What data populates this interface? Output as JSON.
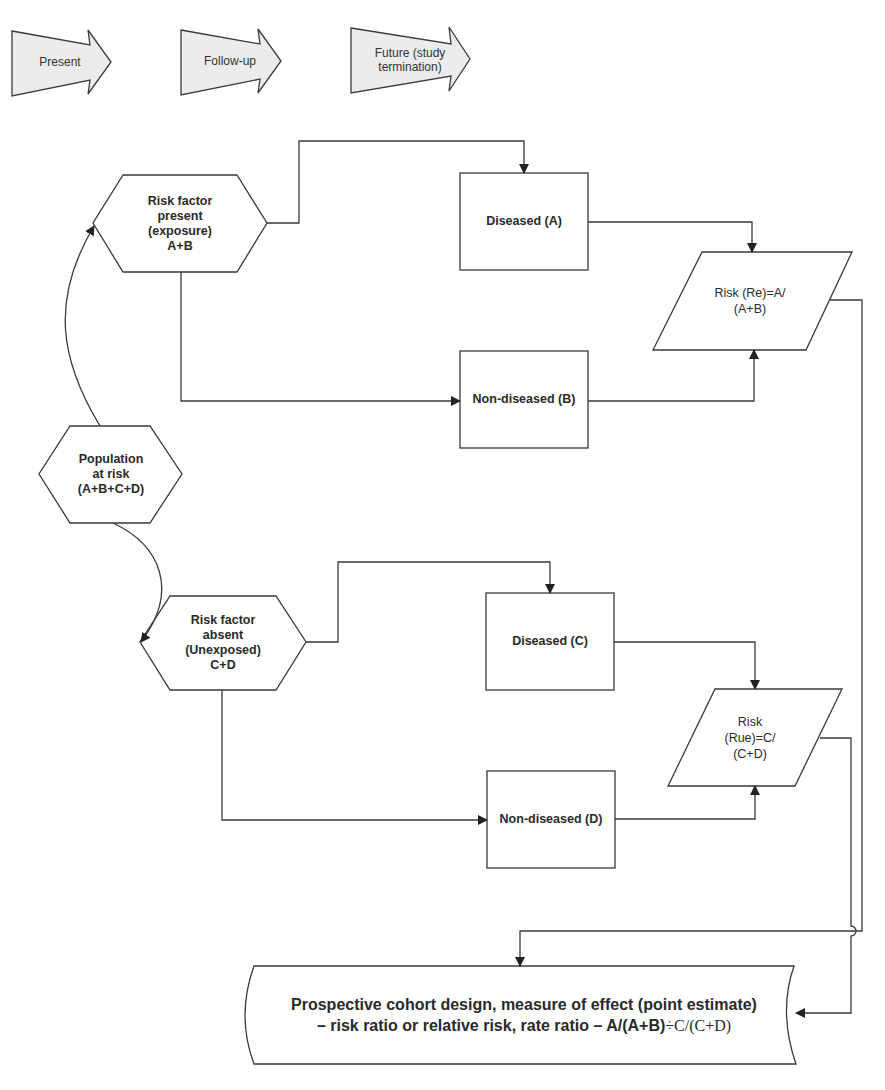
{
  "phases": [
    {
      "label": "Present"
    },
    {
      "label": "Follow-up"
    },
    {
      "label": "Future (study termination)"
    }
  ],
  "nodes": {
    "population": {
      "lines": [
        "Population",
        "at risk",
        "(A+B+C+D)"
      ]
    },
    "exposed": {
      "lines": [
        "Risk factor",
        "present",
        "(exposure)",
        "A+B"
      ]
    },
    "unexposed": {
      "lines": [
        "Risk factor",
        "absent",
        "(Unexposed)",
        "C+D"
      ]
    },
    "diseased_a": {
      "label": "Diseased (A)"
    },
    "nondiseased_b": {
      "label": "Non-diseased (B)"
    },
    "diseased_c": {
      "label": "Diseased (C)"
    },
    "nondiseased_d": {
      "label": "Non-diseased (D)"
    },
    "risk_exposed": {
      "lines": [
        "Risk (Re)=A/",
        "(A+B)"
      ]
    },
    "risk_unexposed": {
      "lines": [
        "Risk",
        "(Rue)=C/",
        "(C+D)"
      ]
    },
    "result": {
      "line1": "Prospective cohort design, measure of effect (point estimate)",
      "line2_bold": "– risk ratio or relative risk, rate ratio – A/(A+B)",
      "line2_serif": "÷C/(C+D)"
    }
  },
  "colors": {
    "stroke": "#3a3a3a",
    "phase_fill": "#ececec",
    "background": "#ffffff"
  }
}
